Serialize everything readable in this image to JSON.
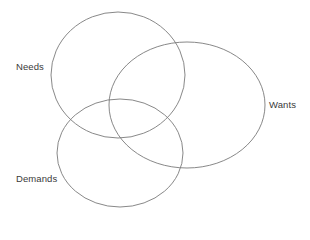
{
  "diagram": {
    "type": "venn",
    "stroke_color": "#7a7a7a",
    "text_color": "#3a3a3a",
    "sets": [
      {
        "id": "needs",
        "label": "Needs",
        "cx": 118,
        "cy": 75,
        "rx": 67,
        "ry": 63,
        "label_x": 16,
        "label_y": 62
      },
      {
        "id": "wants",
        "label": "Wants",
        "cx": 187,
        "cy": 105,
        "rx": 78,
        "ry": 63,
        "label_x": 269,
        "label_y": 100
      },
      {
        "id": "demands",
        "label": "Demands",
        "cx": 120,
        "cy": 153,
        "rx": 63,
        "ry": 54,
        "label_x": 16,
        "label_y": 174
      }
    ]
  }
}
